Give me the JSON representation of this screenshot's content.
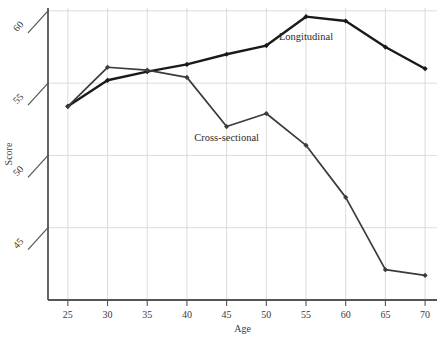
{
  "chart_data": {
    "type": "line",
    "title": "",
    "xlabel": "Age",
    "ylabel": "Score",
    "x": [
      25,
      30,
      35,
      40,
      45,
      50,
      55,
      60,
      65,
      70
    ],
    "xtick_labels": [
      "25",
      "30",
      "35",
      "40",
      "45",
      "50",
      "55",
      "60",
      "65",
      "70"
    ],
    "ytick_labels": [
      "45",
      "50",
      "55",
      "60"
    ],
    "yticks": [
      45,
      50,
      55,
      60
    ],
    "xlim": [
      22.5,
      71.5
    ],
    "ylim": [
      40.0,
      60.2
    ],
    "grid": true,
    "legend_position": "inline-annotation",
    "series": [
      {
        "name": "Longitudinal",
        "color": "#1a1a1a",
        "line_width": 2.4,
        "marker": "diamond",
        "values": [
          53.4,
          55.2,
          55.8,
          56.3,
          57.0,
          57.6,
          59.6,
          59.3,
          57.5,
          56.0
        ],
        "label_x": 55,
        "label_y": 58.0
      },
      {
        "name": "Cross-sectional",
        "color": "#3b3b3b",
        "line_width": 1.7,
        "marker": "diamond",
        "values": [
          53.4,
          56.1,
          55.9,
          55.4,
          52.0,
          52.9,
          50.7,
          47.1,
          42.1,
          41.7
        ],
        "label_x": 45,
        "label_y": 51.0
      }
    ],
    "annotations": [
      {
        "text": "Longitudinal",
        "x": 55,
        "y": 58.0
      },
      {
        "text": "Cross-sectional",
        "x": 45,
        "y": 51.0
      }
    ],
    "style": {
      "axis_color": "#555555",
      "grid_color": "#d8d8d8",
      "background": "#ffffff",
      "tick_style": "slanted"
    }
  }
}
